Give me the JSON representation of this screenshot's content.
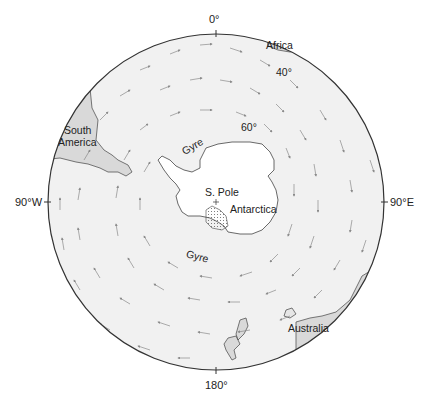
{
  "map": {
    "title": "Southern Ocean circulation around Antarctica",
    "colors": {
      "background": "#ffffff",
      "ocean": "#f1f1f1",
      "land_other": "#d9d9d9",
      "antarctica": "#ffffff",
      "outline": "#333333",
      "arrows": "#8a8a8a"
    },
    "longitude_labels": {
      "top": "0°",
      "left": "90°W",
      "right": "90°E",
      "bottom": "180°"
    },
    "latitude_labels": [
      "40°",
      "60°"
    ],
    "place_labels": {
      "africa": "Africa",
      "south_america_line1": "South",
      "south_america_line2": "America",
      "australia": "Australia",
      "antarctica": "Antarctica",
      "south_pole": "S. Pole",
      "gyre_weddell": "Gyre",
      "gyre_ross": "Gyre"
    },
    "projection": {
      "center_x": 216,
      "center_y": 202,
      "radius": 168
    }
  }
}
